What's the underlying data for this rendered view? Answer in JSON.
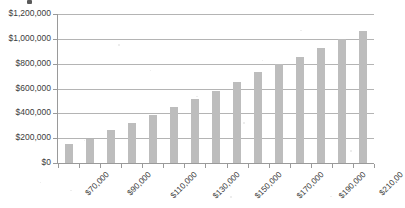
{
  "chart_data": {
    "type": "bar",
    "title": "",
    "xlabel": "",
    "ylabel": "",
    "grid": true,
    "legend": false,
    "ylim": [
      0,
      1200000
    ],
    "ytick_step": 200000,
    "ytick_labels": [
      "$1,200,000",
      "$1,000,000",
      "$800,000",
      "$600,000",
      "$400,000",
      "$200,000",
      "$0"
    ],
    "ytick_values": [
      1200000,
      1000000,
      800000,
      600000,
      400000,
      200000,
      0
    ],
    "xtick_labels": [
      "$70,000",
      "$90,000",
      "$110,000",
      "$130,000",
      "$150,000",
      "$170,000",
      "$190,000",
      "$210,00"
    ],
    "xtick_bar_indices": [
      0,
      2,
      4,
      6,
      8,
      10,
      12,
      14
    ],
    "categories": [
      "$70,000",
      "$80,000",
      "$90,000",
      "$100,000",
      "$110,000",
      "$120,000",
      "$130,000",
      "$140,000",
      "$150,000",
      "$160,000",
      "$170,000",
      "$180,000",
      "$190,000",
      "$200,000",
      "$210,000"
    ],
    "values": [
      153000,
      196000,
      265000,
      326000,
      390000,
      449000,
      512000,
      578000,
      653000,
      729000,
      795000,
      855000,
      925000,
      1000000,
      1062000
    ],
    "bar_color": "#bdbdbd",
    "axis_color": "#9a9a9a",
    "grid_color": "#b4b4b4",
    "text_color": "#3c3c3c",
    "background_color": "#ffffff"
  }
}
